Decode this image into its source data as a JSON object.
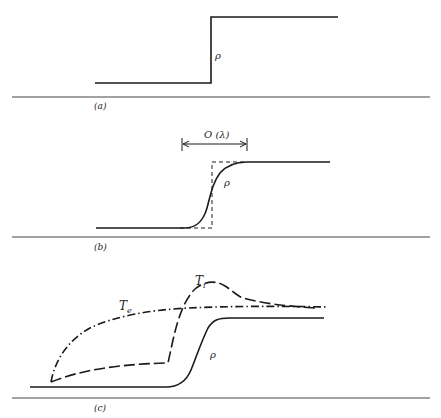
{
  "figure": {
    "panels": [
      {
        "id": "a",
        "label": "(a)",
        "curves": [
          {
            "name": "density",
            "symbol": "ρ",
            "style": "solid",
            "shape": "sharp step"
          }
        ]
      },
      {
        "id": "b",
        "label": "(b)",
        "width_annotation": "O (λ)",
        "curves": [
          {
            "name": "density",
            "symbol": "ρ",
            "style": "solid",
            "shape": "smooth step"
          },
          {
            "name": "reference-step",
            "symbol": "",
            "style": "dashed",
            "shape": "sharp step"
          }
        ]
      },
      {
        "id": "c",
        "label": "(c)",
        "curves": [
          {
            "name": "density",
            "symbol": "ρ",
            "style": "solid",
            "shape": "smooth step"
          },
          {
            "name": "ion-temperature",
            "symbol": "T",
            "subscript": "i",
            "style": "long-dash",
            "shape": "precursor rise, jump, overshoot, relax"
          },
          {
            "name": "electron-temperature",
            "symbol": "T",
            "subscript": "e",
            "style": "dash-dot",
            "shape": "smooth monotonic rise"
          }
        ]
      }
    ]
  },
  "colors": {
    "line": "#1a1a1a",
    "background": "#ffffff"
  }
}
